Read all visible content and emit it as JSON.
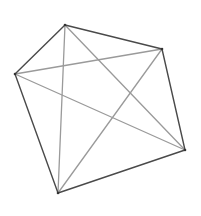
{
  "diagram": {
    "type": "complete-graph-pentagon",
    "vertices": [
      {
        "id": "top",
        "x": 65,
        "y": 25
      },
      {
        "id": "right",
        "x": 162,
        "y": 49
      },
      {
        "id": "bottom-right",
        "x": 185,
        "y": 150
      },
      {
        "id": "bottom",
        "x": 58,
        "y": 193
      },
      {
        "id": "left",
        "x": 15,
        "y": 74
      }
    ],
    "outer_edges": [
      [
        "top",
        "right"
      ],
      [
        "right",
        "bottom-right"
      ],
      [
        "bottom-right",
        "bottom"
      ],
      [
        "bottom",
        "left"
      ],
      [
        "left",
        "top"
      ]
    ],
    "diagonals": [
      [
        "top",
        "bottom-right"
      ],
      [
        "top",
        "bottom"
      ],
      [
        "right",
        "bottom"
      ],
      [
        "right",
        "left"
      ],
      [
        "bottom-right",
        "left"
      ]
    ],
    "colors": {
      "background": "#ffffff",
      "outer_edge": "#4a4a4a",
      "diagonal": "#9a9a9a",
      "vertex": "#333333"
    }
  }
}
